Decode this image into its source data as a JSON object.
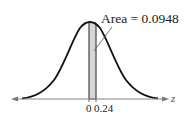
{
  "figure": {
    "type": "normal-distribution-diagram",
    "area_label": "Area = 0.0948",
    "axis_label": "z",
    "tick_labels": [
      "0",
      "0.24"
    ],
    "shaded_region": {
      "from": 0,
      "to": 0.24,
      "area": 0.0948
    },
    "colors": {
      "curve": "#111111",
      "shade": "#d6d6d6",
      "axis": "#777777"
    }
  }
}
